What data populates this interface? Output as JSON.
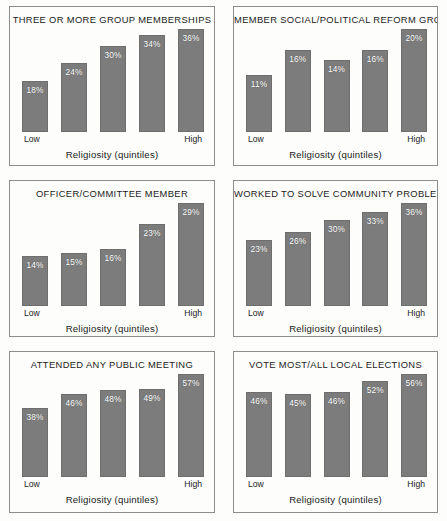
{
  "figure": {
    "background": "#fdfdfc",
    "bar_color": "#7c7c7c",
    "bar_label_color": "#ffffff",
    "panel_border_color": "#8d8d8d",
    "text_color": "#1b1b1b"
  },
  "chart_data": [
    {
      "type": "bar",
      "title": "THREE OR MORE GROUP MEMBERSHIPS",
      "xlabel": "Religiosity (quintiles)",
      "ylabel": "",
      "categories": [
        "Low",
        "",
        "",
        "",
        "High"
      ],
      "tick_low": "Low",
      "tick_high": "High",
      "values": [
        18,
        24,
        30,
        34,
        36
      ],
      "data_labels": [
        "18%",
        "24%",
        "30%",
        "34%",
        "36%"
      ],
      "ylim": [
        0,
        36
      ],
      "grid": false,
      "legend": "none"
    },
    {
      "type": "bar",
      "title": "MEMBER SOCIAL/POLITICAL REFORM GROUP",
      "xlabel": "Religiosity (quintiles)",
      "ylabel": "",
      "categories": [
        "Low",
        "",
        "",
        "",
        "High"
      ],
      "tick_low": "Low",
      "tick_high": "High",
      "values": [
        11,
        16,
        14,
        16,
        20
      ],
      "data_labels": [
        "11%",
        "16%",
        "14%",
        "16%",
        "20%"
      ],
      "ylim": [
        0,
        20
      ],
      "grid": false,
      "legend": "none"
    },
    {
      "type": "bar",
      "title": "OFFICER/COMMITTEE MEMBER",
      "xlabel": "Religiosity (quintiles)",
      "ylabel": "",
      "categories": [
        "Low",
        "",
        "",
        "",
        "High"
      ],
      "tick_low": "Low",
      "tick_high": "High",
      "values": [
        14,
        15,
        16,
        23,
        29
      ],
      "data_labels": [
        "14%",
        "15%",
        "16%",
        "23%",
        "29%"
      ],
      "ylim": [
        0,
        29
      ],
      "grid": false,
      "legend": "none"
    },
    {
      "type": "bar",
      "title": "WORKED TO SOLVE COMMUNITY PROBLEM",
      "xlabel": "Religiosity (quintiles)",
      "ylabel": "",
      "categories": [
        "Low",
        "",
        "",
        "",
        "High"
      ],
      "tick_low": "Low",
      "tick_high": "High",
      "values": [
        23,
        26,
        30,
        33,
        36
      ],
      "data_labels": [
        "23%",
        "26%",
        "30%",
        "33%",
        "36%"
      ],
      "ylim": [
        0,
        36
      ],
      "grid": false,
      "legend": "none"
    },
    {
      "type": "bar",
      "title": "ATTENDED ANY PUBLIC MEETING",
      "xlabel": "Religiosity (quintiles)",
      "ylabel": "",
      "categories": [
        "Low",
        "",
        "",
        "",
        "High"
      ],
      "tick_low": "Low",
      "tick_high": "High",
      "values": [
        38,
        46,
        48,
        49,
        57
      ],
      "data_labels": [
        "38%",
        "46%",
        "48%",
        "49%",
        "57%"
      ],
      "ylim": [
        0,
        57
      ],
      "grid": false,
      "legend": "none"
    },
    {
      "type": "bar",
      "title": "VOTE MOST/ALL LOCAL ELECTIONS",
      "xlabel": "Religiosity (quintiles)",
      "ylabel": "",
      "categories": [
        "Low",
        "",
        "",
        "",
        "High"
      ],
      "tick_low": "Low",
      "tick_high": "High",
      "values": [
        46,
        45,
        46,
        52,
        56
      ],
      "data_labels": [
        "46%",
        "45%",
        "46%",
        "52%",
        "56%"
      ],
      "ylim": [
        0,
        56
      ],
      "grid": false,
      "legend": "none"
    }
  ]
}
